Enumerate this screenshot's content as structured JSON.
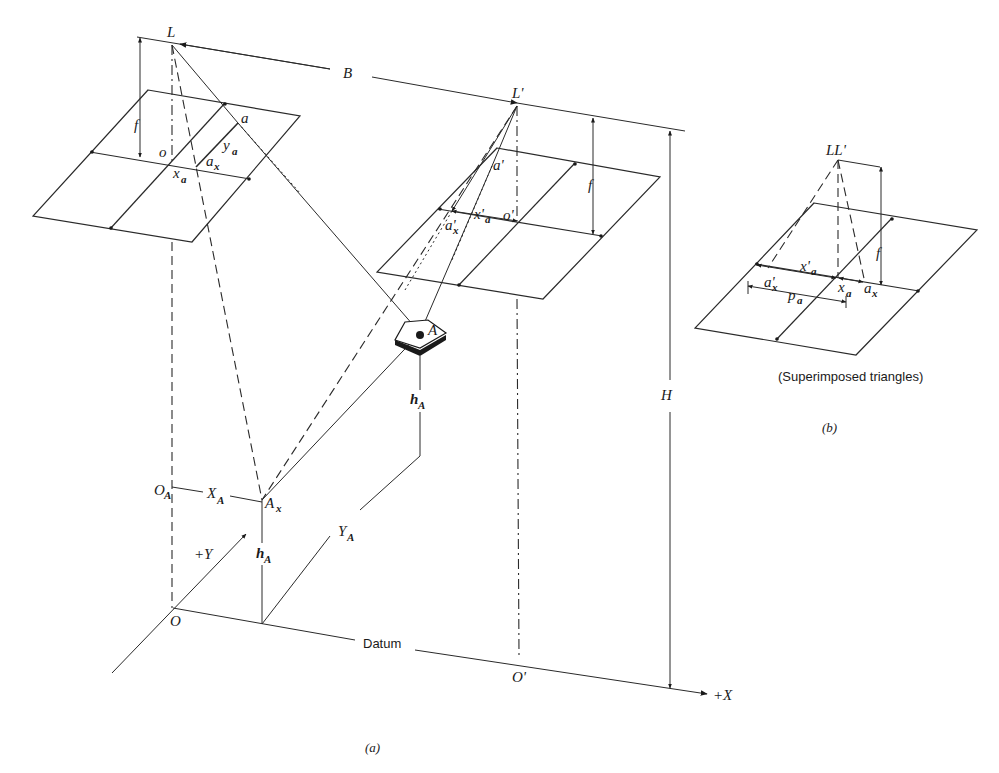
{
  "figure": {
    "panel_a": {
      "caption": "(a)",
      "exposure_stations": {
        "left": "L",
        "right": "L'"
      },
      "air_base_label": "B",
      "focal_length_label": "f",
      "flying_height_label": "H",
      "left_photo": {
        "principal_point": "o",
        "image_point": "a",
        "x_component_point": "a",
        "x_component_sub": "x",
        "x_coord": "x",
        "x_coord_sub": "a",
        "y_coord": "y",
        "y_coord_sub": "a"
      },
      "right_photo": {
        "principal_point": "o'",
        "image_point": "a'",
        "x_component_point": "a'",
        "x_component_sub": "x",
        "x_coord": "x'",
        "x_coord_sub": "a"
      },
      "ground": {
        "object_point": "A",
        "object_x_point": "A",
        "object_x_sub": "x",
        "elevation": "h",
        "elevation_sub": "A",
        "X_coord": "X",
        "X_coord_sub": "A",
        "Y_coord": "Y",
        "Y_coord_sub": "A",
        "offset_origin": "O",
        "offset_origin_sub": "A",
        "origin": "O",
        "origin_prime": "O'",
        "datum_label": "Datum",
        "plus_x": "+X",
        "plus_y": "+Y"
      }
    },
    "panel_b": {
      "caption": "(b)",
      "subtitle": "(Superimposed triangles)",
      "station_label": "LL'",
      "focal_length_label": "f",
      "x_prime": "x'",
      "x_prime_sub": "a",
      "a_prime": "a'",
      "a_prime_sub": "x",
      "parallax": "p",
      "parallax_sub": "a",
      "x_coord": "x",
      "x_coord_sub": "a",
      "a_x": "a",
      "a_x_sub": "x"
    }
  }
}
